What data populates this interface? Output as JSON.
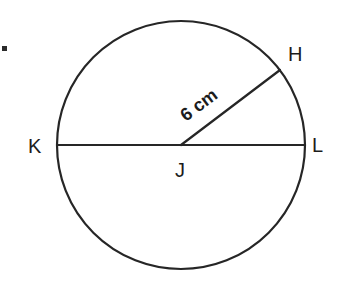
{
  "figure": {
    "kind": "circle-diagram",
    "background_color": "#ffffff",
    "stroke_color": "#262626",
    "text_color": "#1c1c1c",
    "width": 341,
    "height": 286
  },
  "circle": {
    "center_label": "J",
    "center_x": 181,
    "center_y": 145,
    "radius": 124
  },
  "points": {
    "center": "J",
    "left": "K",
    "right": "L",
    "radius_end": "H"
  },
  "labels": {
    "center": "J",
    "left_endpoint": "K",
    "right_endpoint": "L",
    "upper_right": "H"
  },
  "measurements": {
    "radius_label": "6 cm",
    "radius_value": "6",
    "radius_unit": "cm",
    "radius_angle_deg": "-37"
  },
  "segments": {
    "diameter": "KL",
    "radius": "JH"
  }
}
